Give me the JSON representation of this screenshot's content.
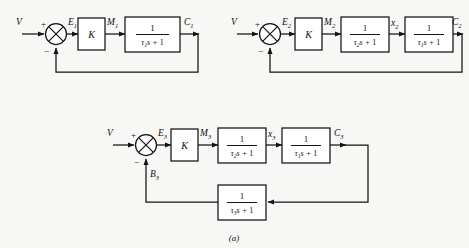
{
  "figure": {
    "caption": "(a)",
    "ink_color": "#141414",
    "background_color": "#f7f7f5",
    "block_fill": "#ffffff"
  },
  "diagrams": [
    {
      "id": "diagram-1",
      "input_label": "V",
      "sum_plus": "+",
      "sum_minus": "−",
      "error_label": "E",
      "error_sub": "1",
      "gain_label": "K",
      "gain_out_label": "M",
      "gain_out_sub": "1",
      "blocks": [
        {
          "numerator": "1",
          "den_tau": "τ",
          "den_tau_sub": "1",
          "den_s": "s",
          "den_op": "+",
          "den_const": "1",
          "output_label": "C",
          "output_sub": "1"
        }
      ]
    },
    {
      "id": "diagram-2",
      "input_label": "V",
      "sum_plus": "+",
      "sum_minus": "−",
      "error_label": "E",
      "error_sub": "2",
      "gain_label": "K",
      "gain_out_label": "M",
      "gain_out_sub": "2",
      "blocks": [
        {
          "numerator": "1",
          "den_tau": "τ",
          "den_tau_sub": "2",
          "den_s": "s",
          "den_op": "+",
          "den_const": "1",
          "output_label": "x",
          "output_sub": "2"
        },
        {
          "numerator": "1",
          "den_tau": "τ",
          "den_tau_sub": "1",
          "den_s": "s",
          "den_op": "+",
          "den_const": "1",
          "output_label": "C",
          "output_sub": "2"
        }
      ]
    },
    {
      "id": "diagram-3",
      "input_label": "V",
      "sum_plus": "+",
      "sum_minus": "−",
      "error_label": "E",
      "error_sub": "3",
      "gain_label": "K",
      "gain_out_label": "M",
      "gain_out_sub": "3",
      "feedback_signal_label": "B",
      "feedback_signal_sub": "3",
      "blocks": [
        {
          "numerator": "1",
          "den_tau": "τ",
          "den_tau_sub": "2",
          "den_s": "s",
          "den_op": "+",
          "den_const": "1",
          "output_label": "x",
          "output_sub": "3"
        },
        {
          "numerator": "1",
          "den_tau": "τ",
          "den_tau_sub": "1",
          "den_s": "s",
          "den_op": "+",
          "den_const": "1",
          "output_label": "C",
          "output_sub": "3"
        }
      ],
      "feedback_block": {
        "numerator": "1",
        "den_tau": "τ",
        "den_tau_sub": "3",
        "den_s": "s",
        "den_op": "+",
        "den_const": "1"
      }
    }
  ]
}
